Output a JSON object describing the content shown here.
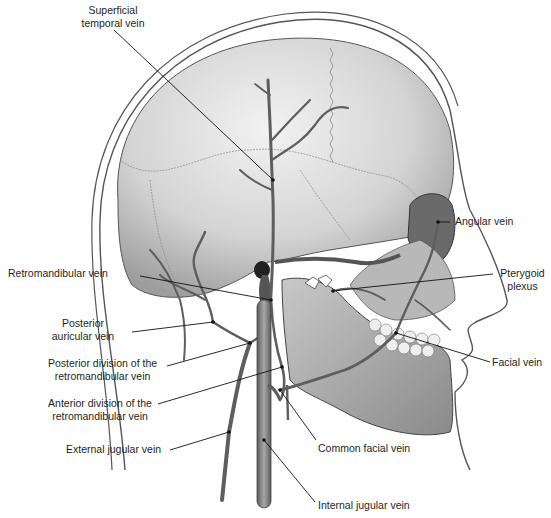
{
  "figure": {
    "labels": [
      {
        "id": "superficial-temporal",
        "lines": [
          "Superficial",
          "temporal vein"
        ],
        "x": 58,
        "y": 4,
        "w": 110,
        "align": "center",
        "pointer": [
          [
            114,
            30
          ],
          [
            273,
            180
          ]
        ]
      },
      {
        "id": "angular",
        "lines": [
          "Angular vein"
        ],
        "x": 455,
        "y": 215,
        "w": 90,
        "align": "left",
        "pointer": [
          [
            450,
            222
          ],
          [
            438,
            222
          ]
        ]
      },
      {
        "id": "pterygoid",
        "lines": [
          "Pterygoid",
          "plexus"
        ],
        "x": 495,
        "y": 267,
        "w": 55,
        "align": "center",
        "pointer": [
          [
            493,
            274
          ],
          [
            360,
            288
          ],
          [
            333,
            291
          ]
        ]
      },
      {
        "id": "retromandibular",
        "lines": [
          "Retromandibular vein"
        ],
        "x": 8,
        "y": 267,
        "w": 130,
        "align": "left",
        "pointer": [
          [
            140,
            276
          ],
          [
            271,
            300
          ]
        ]
      },
      {
        "id": "posterior-auricular",
        "lines": [
          "Posterior",
          "auricular vein"
        ],
        "x": 38,
        "y": 317,
        "w": 90,
        "align": "center",
        "pointer": [
          [
            132,
            332
          ],
          [
            213,
            322
          ]
        ]
      },
      {
        "id": "posterior-division",
        "lines": [
          "Posterior division of the",
          "retromandibular vein"
        ],
        "x": 30,
        "y": 357,
        "w": 145,
        "align": "center",
        "pointer": [
          [
            167,
            366
          ],
          [
            250,
            343
          ]
        ]
      },
      {
        "id": "anterior-division",
        "lines": [
          "Anterior division of the",
          "retromandibular vein"
        ],
        "x": 30,
        "y": 397,
        "w": 140,
        "align": "center",
        "pointer": [
          [
            158,
            404
          ],
          [
            282,
            367
          ]
        ]
      },
      {
        "id": "external-jugular",
        "lines": [
          "External jugular vein"
        ],
        "x": 66,
        "y": 443,
        "w": 110,
        "align": "left",
        "pointer": [
          [
            170,
            450
          ],
          [
            229,
            432
          ]
        ]
      },
      {
        "id": "common-facial",
        "lines": [
          "Common facial vein"
        ],
        "x": 318,
        "y": 442,
        "w": 110,
        "align": "left",
        "pointer": [
          [
            316,
            440
          ],
          [
            280,
            390
          ]
        ]
      },
      {
        "id": "facial",
        "lines": [
          "Facial vein"
        ],
        "x": 492,
        "y": 356,
        "w": 70,
        "align": "left",
        "pointer": [
          [
            490,
            362
          ],
          [
            396,
            333
          ]
        ]
      },
      {
        "id": "internal-jugular",
        "lines": [
          "Internal jugular vein"
        ],
        "x": 318,
        "y": 499,
        "w": 110,
        "align": "left",
        "pointer": [
          [
            315,
            502
          ],
          [
            264,
            440
          ]
        ]
      }
    ],
    "colors": {
      "skin_outline": "#4a4a4a",
      "skull_fill": "#d9d9d9",
      "skull_shadow": "#9a9a9a",
      "vein": "#6f6f6f",
      "vein_edge": "#444444",
      "leader": "#111111"
    }
  }
}
